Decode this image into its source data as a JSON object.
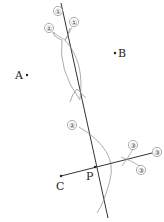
{
  "diagram": {
    "type": "geometric-construction",
    "points": {
      "A": {
        "label": "A",
        "x": 27,
        "y": 75
      },
      "B": {
        "label": "B",
        "x": 115,
        "y": 53
      },
      "C": {
        "label": "C",
        "x": 61,
        "y": 176
      },
      "P": {
        "label": "P",
        "x": 95,
        "y": 165
      }
    },
    "step_marks": {
      "step1": [
        "①",
        "①",
        "①"
      ],
      "step2": [
        "②"
      ],
      "step3": [
        "③",
        "③",
        "③"
      ]
    },
    "colors": {
      "line": "#333333",
      "arc": "#888888",
      "mark": "#777777",
      "text": "#222222"
    }
  }
}
